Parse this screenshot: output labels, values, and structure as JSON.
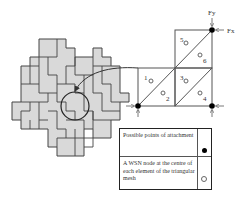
{
  "diagram": {
    "type": "tiling-to-triangular-mesh",
    "tiling": {
      "description": "Grey L-shaped tiles forming an interlocking pavement",
      "highlight_circle": true
    },
    "mesh": {
      "element_labels": [
        "1",
        "2",
        "3",
        "4",
        "5",
        "6"
      ],
      "force_labels": {
        "fy": "Fy",
        "fx": "Fx"
      }
    },
    "legend": {
      "rows": [
        {
          "text": "Possible points of attachment",
          "symbol": "filled-dot"
        },
        {
          "text": "A WSN node at the centre of each element of the triangular mesh",
          "symbol": "open-dot"
        }
      ]
    },
    "colors": {
      "tile_fill": "#d9d9d9",
      "line": "#333333"
    }
  }
}
